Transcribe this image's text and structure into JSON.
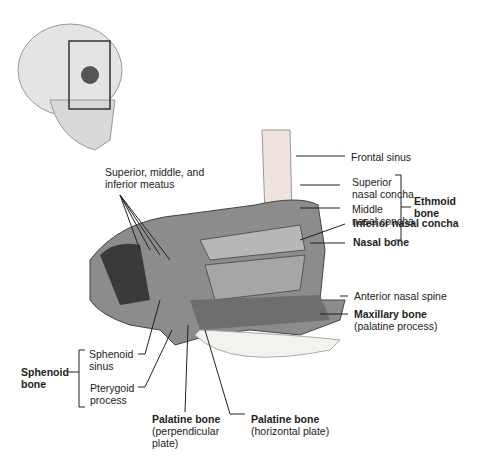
{
  "figure": {
    "inset": "Skull with highlighted region",
    "labels": {
      "frontal_sinus": "Frontal sinus",
      "superior_concha_1": "Superior",
      "superior_concha_2": "nasal concha",
      "middle_concha_1": "Middle",
      "middle_concha_2": "nasal concha",
      "ethmoid_1": "Ethmoid",
      "ethmoid_2": "bone",
      "inferior_concha": "Inferior nasal concha",
      "nasal_bone": "Nasal bone",
      "meatus_1": "Superior, middle, and",
      "meatus_2": "inferior meatus",
      "anterior_spine": "Anterior nasal spine",
      "maxillary_1": "Maxillary bone",
      "maxillary_2": "(palatine process)",
      "sphenoid_1": "Sphenoid",
      "sphenoid_2": "bone",
      "sphenoid_sinus_1": "Sphenoid",
      "sphenoid_sinus_2": "sinus",
      "pterygoid_1": "Pterygoid",
      "pterygoid_2": "process",
      "palatine_perp_1": "Palatine bone",
      "palatine_perp_2": "(perpendicular",
      "palatine_perp_3": "plate)",
      "palatine_horiz_1": "Palatine bone",
      "palatine_horiz_2": "(horizontal plate)"
    }
  }
}
